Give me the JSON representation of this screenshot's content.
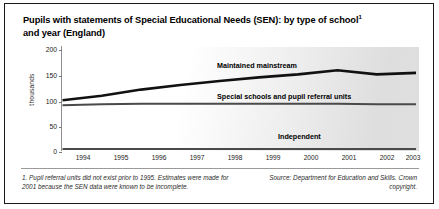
{
  "figure": {
    "title_line1": "Pupils with statements of Special Educational Needs (SEN): by type of school",
    "title_line2": "and year (England)",
    "title_footnote_marker": "1",
    "footnote": "1. Pupil referral units did not exist prior to 1995. Estimates were made for 2001 because the SEN data were known to be incomplete.",
    "source": "Source: Department for Education and Skills. Crown copyright."
  },
  "chart_data": {
    "type": "line",
    "xlabel": "",
    "ylabel": "thousands",
    "categories": [
      "1994",
      "1995",
      "1996",
      "1997",
      "1998",
      "1999",
      "2000",
      "2001",
      "2002",
      "2003"
    ],
    "x_tick_labels": [
      "1994",
      "1995",
      "1996",
      "1997",
      "1998",
      "1999",
      "2000",
      "2001",
      "2002",
      "2003"
    ],
    "y_tick_labels": [
      "0",
      "50",
      "100",
      "150",
      "200"
    ],
    "ylim": [
      0,
      200
    ],
    "y_ticks": [
      0,
      50,
      100,
      150,
      200
    ],
    "grid": false,
    "legend": "inline-labels",
    "series": [
      {
        "name": "Maintained mainstream",
        "color": "#111111",
        "values": [
          101,
          110,
          122,
          131,
          139,
          146,
          152,
          160,
          152,
          155
        ]
      },
      {
        "name": "Special schools and pupil referral units",
        "color": "#4a4a4a",
        "values": [
          91,
          93,
          94,
          94,
          94,
          94,
          94,
          94,
          93,
          93
        ]
      },
      {
        "name": "Independent",
        "color": "#4a4a4a",
        "values": [
          5,
          5,
          5,
          5,
          5,
          5,
          5,
          5,
          5,
          5
        ]
      }
    ],
    "annotations": [
      {
        "text": "Maintained mainstream",
        "x": 2001,
        "y": 178
      },
      {
        "text": "Special schools and pupil referral units",
        "x": 2000,
        "y": 104
      },
      {
        "text": "Independent",
        "x": 2001,
        "y": 22
      }
    ]
  }
}
